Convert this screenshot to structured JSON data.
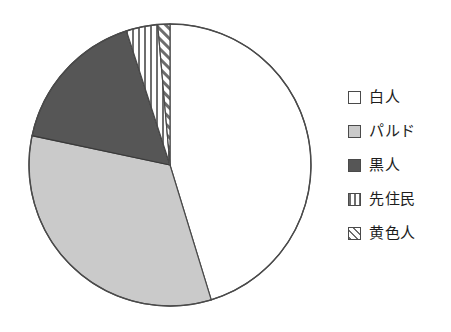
{
  "chart_data": {
    "type": "pie",
    "title": "",
    "subtitle": "",
    "xlabel": "",
    "ylabel": "",
    "grid": false,
    "legend_position": "right",
    "start_angle_deg": 0,
    "direction": "clockwise",
    "center": {
      "x": 170,
      "y": 165
    },
    "radius": 141,
    "categories": [
      "白人",
      "パルド",
      "黒人",
      "先住民",
      "黄色人"
    ],
    "values": [
      45.3,
      33.1,
      16.7,
      3.6,
      1.3
    ],
    "unit": "%",
    "slices": [
      {
        "label": "白人",
        "value": 45.3,
        "start_deg": 0,
        "end_deg": 163,
        "fill": "#ffffff",
        "pattern": "solid",
        "stroke": "#4a4a4a"
      },
      {
        "label": "パルド",
        "value": 33.1,
        "start_deg": 163,
        "end_deg": 282,
        "fill": "#cacaca",
        "pattern": "solid",
        "stroke": "#4a4a4a"
      },
      {
        "label": "黒人",
        "value": 16.7,
        "start_deg": 282,
        "end_deg": 342,
        "fill": "#565656",
        "pattern": "solid",
        "stroke": "#3a3a3a"
      },
      {
        "label": "先住民",
        "value": 3.6,
        "start_deg": 342,
        "end_deg": 355,
        "fill": "#ffffff",
        "pattern": "vertical-stripes",
        "stroke": "#4a4a4a"
      },
      {
        "label": "黄色人",
        "value": 1.3,
        "start_deg": 355,
        "end_deg": 360,
        "fill": "#ffffff",
        "pattern": "diagonal-hatch",
        "stroke": "#4a4a4a"
      }
    ]
  },
  "legend": {
    "items": [
      {
        "label": "白人",
        "pattern": "solid",
        "fill": "#ffffff",
        "swatch_name": "legend-swatch-white"
      },
      {
        "label": "パルド",
        "pattern": "solid",
        "fill": "#cacaca",
        "swatch_name": "legend-swatch-pardo"
      },
      {
        "label": "黒人",
        "pattern": "solid",
        "fill": "#565656",
        "swatch_name": "legend-swatch-black"
      },
      {
        "label": "先住民",
        "pattern": "vertical-stripes",
        "fill": "#ffffff",
        "swatch_name": "legend-swatch-indigenous"
      },
      {
        "label": "黄色人",
        "pattern": "diagonal-hatch",
        "fill": "#ffffff",
        "swatch_name": "legend-swatch-yellow"
      }
    ]
  },
  "colors": {
    "background": "#ffffff",
    "outline": "#4a4a4a",
    "light_gray": "#cacaca",
    "dark_gray": "#565656",
    "text": "#1d1d1d"
  }
}
